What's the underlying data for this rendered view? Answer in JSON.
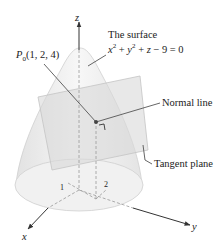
{
  "figure": {
    "axes": {
      "x": "x",
      "y": "y",
      "z": "z"
    },
    "ticks": {
      "x_tick": "1",
      "y_tick": "2"
    },
    "point": {
      "name": "P",
      "subscript": "0",
      "coords": "(1, 2, 4)"
    },
    "surface_label": {
      "line1": "The surface",
      "line2_parts": [
        "x",
        "2",
        " + ",
        "y",
        "2",
        " + ",
        "z",
        " − 9 = 0"
      ]
    },
    "normal_label": "Normal line",
    "tangent_label": "Tangent plane",
    "colors": {
      "surface_fill": "#ececec",
      "plane_fill": "#dcdcdc",
      "line": "#444444",
      "text": "#222222"
    }
  }
}
